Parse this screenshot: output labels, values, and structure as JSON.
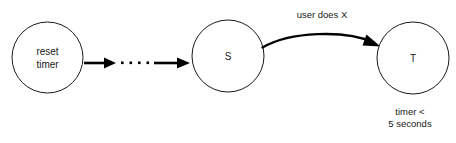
{
  "diagram": {
    "background_color": "#ffffff",
    "stroke_color": "#1a1a1a",
    "edge_color": "#000000",
    "nodes": [
      {
        "id": "reset-timer",
        "shape": "circle",
        "label_line1": "reset",
        "label_line2": "timer",
        "cx": 47.5,
        "cy": 57.5,
        "r": 35.5
      },
      {
        "id": "s",
        "shape": "circle",
        "label": "S",
        "cx": 228,
        "cy": 56,
        "r": 36
      },
      {
        "id": "t",
        "shape": "circle",
        "label": "T",
        "cx": 413,
        "cy": 58,
        "r": 36
      }
    ],
    "edges": [
      {
        "id": "reset-to-ellipsis",
        "style": "solid-arrow",
        "from": "reset-timer",
        "to": "ellipsis"
      },
      {
        "id": "ellipsis",
        "style": "dotted",
        "dot_count": 4
      },
      {
        "id": "ellipsis-to-s",
        "style": "solid-arrow",
        "from": "ellipsis",
        "to": "s"
      },
      {
        "id": "s-to-t",
        "style": "curved-arrow",
        "from": "s",
        "to": "t",
        "label": "user does X"
      }
    ],
    "annotations": [
      {
        "id": "timer-condition",
        "attached_to": "t",
        "line1": "timer <",
        "line2": "5 seconds"
      }
    ]
  }
}
